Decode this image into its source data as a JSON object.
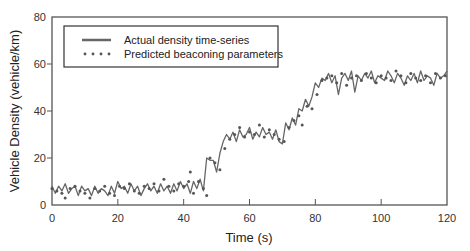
{
  "chart_data": {
    "type": "line",
    "title": "",
    "xlabel": "Time (s)",
    "ylabel": "Vehicle Density (vehicle/km)",
    "xlim": [
      0,
      120
    ],
    "ylim": [
      0,
      80
    ],
    "xticks": [
      0,
      20,
      40,
      60,
      80,
      100,
      120
    ],
    "yticks": [
      0,
      20,
      40,
      60,
      80
    ],
    "grid": false,
    "legend_position": "upper left",
    "series": [
      {
        "name": "Actual density time-series",
        "style": "solid line",
        "color": "#666666",
        "x": [
          0,
          1,
          2,
          3,
          4,
          5,
          6,
          7,
          8,
          9,
          10,
          11,
          12,
          13,
          14,
          15,
          16,
          17,
          18,
          19,
          20,
          21,
          22,
          23,
          24,
          25,
          26,
          27,
          28,
          29,
          30,
          31,
          32,
          33,
          34,
          35,
          36,
          37,
          38,
          39,
          40,
          41,
          42,
          43,
          44,
          45,
          46,
          47,
          48,
          49,
          50,
          51,
          52,
          53,
          54,
          55,
          56,
          57,
          58,
          59,
          60,
          61,
          62,
          63,
          64,
          65,
          66,
          67,
          68,
          69,
          70,
          71,
          72,
          73,
          74,
          75,
          76,
          77,
          78,
          79,
          80,
          81,
          82,
          83,
          84,
          85,
          86,
          87,
          88,
          89,
          90,
          91,
          92,
          93,
          94,
          95,
          96,
          97,
          98,
          99,
          100,
          101,
          102,
          103,
          104,
          105,
          106,
          107,
          108,
          109,
          110,
          111,
          112,
          113,
          114,
          115,
          116,
          117,
          118,
          119,
          120
        ],
        "values": [
          8,
          5,
          8,
          6,
          9,
          5,
          7,
          8,
          4,
          8,
          6,
          7,
          4,
          8,
          5,
          7,
          6,
          4,
          8,
          5,
          10,
          7,
          8,
          5,
          9,
          6,
          8,
          4,
          7,
          9,
          6,
          8,
          5,
          9,
          6,
          8,
          5,
          9,
          6,
          10,
          7,
          9,
          5,
          10,
          7,
          11,
          6,
          20,
          19,
          19,
          14,
          22,
          27,
          30,
          28,
          31,
          27,
          32,
          29,
          30,
          33,
          28,
          31,
          29,
          33,
          30,
          31,
          28,
          32,
          27,
          26,
          35,
          32,
          37,
          34,
          41,
          40,
          45,
          42,
          46,
          52,
          50,
          54,
          53,
          56,
          52,
          55,
          47,
          54,
          56,
          53,
          57,
          48,
          55,
          53,
          56,
          54,
          57,
          52,
          55,
          54,
          53,
          57,
          55,
          52,
          56,
          54,
          51,
          55,
          53,
          56,
          52,
          57,
          53,
          55,
          54,
          51,
          56,
          54,
          55,
          57
        ]
      },
      {
        "name": "Predicted beaconing parameters",
        "style": "dots",
        "color": "#555555",
        "x": [
          0,
          1.5,
          3,
          4,
          5.5,
          7,
          8.5,
          10,
          11.5,
          13,
          14.5,
          16,
          17.5,
          19,
          20.5,
          22,
          23.5,
          25,
          26.5,
          28,
          29.5,
          31,
          32.5,
          34,
          35.5,
          37,
          38.5,
          40,
          41.5,
          42,
          43,
          44.5,
          46,
          47,
          48,
          49.5,
          51,
          52.5,
          54,
          55.5,
          57,
          58.5,
          60,
          61.5,
          63,
          64.5,
          66,
          67.5,
          69,
          70.5,
          72,
          73.5,
          75,
          76,
          77.5,
          79,
          80.5,
          82,
          83.5,
          85,
          86.5,
          88,
          89.5,
          91,
          92.5,
          94,
          95.5,
          97,
          98.5,
          100,
          101.5,
          103,
          104.5,
          106,
          107.5,
          109,
          110.5,
          112,
          113.5,
          115,
          116.5,
          118,
          119.5
        ],
        "values": [
          7,
          6,
          5,
          3,
          7,
          8,
          6,
          5,
          3,
          7,
          6,
          8,
          5,
          4,
          8,
          7,
          9,
          6,
          5,
          8,
          7,
          9,
          6,
          11,
          8,
          6,
          9,
          8,
          10,
          14,
          5,
          10,
          7,
          4,
          20,
          18,
          15,
          24,
          28,
          30,
          33,
          29,
          31,
          30,
          34,
          29,
          32,
          30,
          28,
          27,
          33,
          36,
          38,
          34,
          42,
          41,
          47,
          53,
          54,
          55,
          52,
          56,
          51,
          54,
          55,
          53,
          56,
          54,
          52,
          55,
          54,
          53,
          57,
          55,
          52,
          56,
          54,
          53,
          55,
          52,
          56,
          54,
          55
        ]
      }
    ]
  },
  "legend": {
    "items": [
      {
        "label": "Actual density time-series"
      },
      {
        "label": "Predicted beaconing parameters"
      }
    ]
  },
  "axes": {
    "x_title": "Time (s)",
    "y_title": "Vehicle Density (vehicle/km)"
  }
}
